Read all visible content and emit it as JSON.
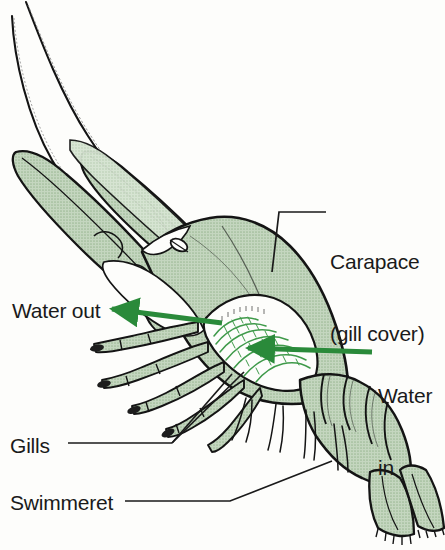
{
  "figure": {
    "background_color": "#fdfdfb",
    "body_fill_color": "#b8cfb3",
    "outline_color": "#141414",
    "gill_color": "#3f9a4a",
    "arrow_color": "#2a8a3a",
    "leader_color": "#1a1a1a"
  },
  "labels": {
    "carapace": {
      "line1": "Carapace",
      "line2": "(gill cover)",
      "name": "carapace-label"
    },
    "water_out": {
      "text": "Water out",
      "name": "water-out-label"
    },
    "water_in": {
      "line1": "Water",
      "line2": "in",
      "name": "water-in-label"
    },
    "gills": {
      "text": "Gills",
      "name": "gills-label"
    },
    "swimmeret": {
      "text": "Swimmeret",
      "name": "swimmeret-label"
    }
  },
  "arrows": {
    "water_out_direction": "left",
    "water_in_direction": "left"
  }
}
